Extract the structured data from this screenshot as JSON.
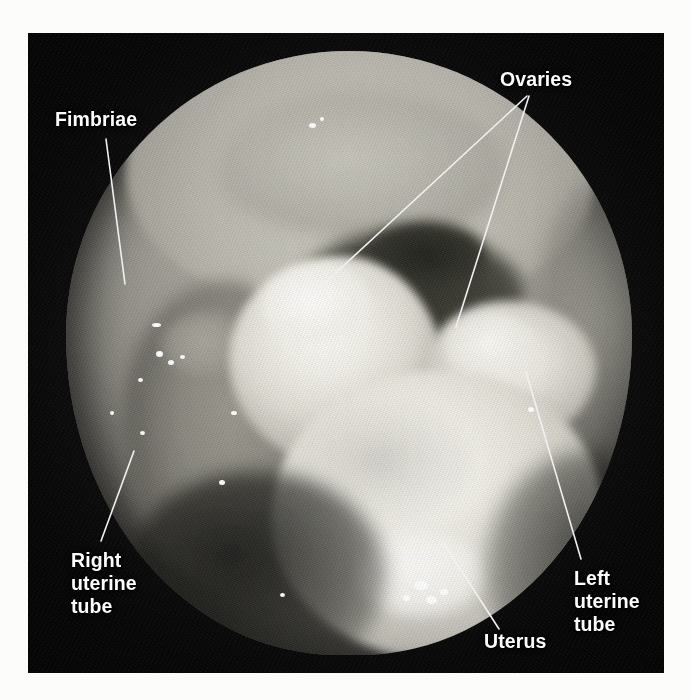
{
  "figure": {
    "type": "laparoscopic-photograph",
    "frame": {
      "left": 28,
      "top": 33,
      "width": 636,
      "height": 640,
      "background_color": "#090909"
    },
    "page_background_color": "#fdfdfb",
    "label_color": "#ffffff",
    "leader_line_color": "#f2f2f2"
  },
  "annotations": [
    {
      "id": "fimbriae",
      "label": "Fimbriae",
      "lines": [
        "Fimbriae"
      ],
      "label_x": 55,
      "label_y": 108,
      "leader": {
        "x1": 106,
        "y1": 139,
        "x2": 125,
        "y2": 284
      }
    },
    {
      "id": "ovaries",
      "label": "Ovaries",
      "lines": [
        "Ovaries"
      ],
      "label_x": 500,
      "label_y": 68,
      "leaders": [
        {
          "x1": 527,
          "y1": 96,
          "x2": 300,
          "y2": 306
        },
        {
          "x1": 529,
          "y1": 96,
          "x2": 456,
          "y2": 327
        }
      ]
    },
    {
      "id": "right-uterine-tube",
      "label": "Right uterine tube",
      "lines": [
        "Right",
        "uterine",
        "tube"
      ],
      "label_x": 71,
      "label_y": 549,
      "leader": {
        "x1": 134,
        "y1": 451,
        "x2": 101,
        "y2": 541
      }
    },
    {
      "id": "left-uterine-tube",
      "label": "Left uterine tube",
      "lines": [
        "Left",
        "uterine",
        "tube"
      ],
      "label_x": 574,
      "label_y": 567,
      "leader": {
        "x1": 526,
        "y1": 372,
        "x2": 581,
        "y2": 559
      }
    },
    {
      "id": "uterus",
      "label": "Uterus",
      "lines": [
        "Uterus"
      ],
      "label_x": 484,
      "label_y": 630,
      "leader": {
        "x1": 443,
        "y1": 542,
        "x2": 499,
        "y2": 629
      }
    }
  ],
  "labels": {
    "fimbriae": "Fimbriae",
    "ovaries": "Ovaries",
    "right_uterine_tube": "Right\nuterine\ntube",
    "left_uterine_tube": "Left\nuterine\ntube",
    "uterus": "Uterus"
  },
  "specular_highlights": [
    {
      "x": 281,
      "y": 90,
      "w": 7,
      "h": 5
    },
    {
      "x": 292,
      "y": 84,
      "w": 4,
      "h": 4
    },
    {
      "x": 124,
      "y": 290,
      "w": 9,
      "h": 4
    },
    {
      "x": 128,
      "y": 318,
      "w": 7,
      "h": 6
    },
    {
      "x": 140,
      "y": 327,
      "w": 6,
      "h": 5
    },
    {
      "x": 152,
      "y": 322,
      "w": 5,
      "h": 4
    },
    {
      "x": 110,
      "y": 345,
      "w": 5,
      "h": 4
    },
    {
      "x": 82,
      "y": 378,
      "w": 4,
      "h": 4
    },
    {
      "x": 112,
      "y": 398,
      "w": 5,
      "h": 4
    },
    {
      "x": 203,
      "y": 378,
      "w": 6,
      "h": 4
    },
    {
      "x": 191,
      "y": 447,
      "w": 6,
      "h": 5
    },
    {
      "x": 386,
      "y": 548,
      "w": 14,
      "h": 9
    },
    {
      "x": 398,
      "y": 563,
      "w": 11,
      "h": 8
    },
    {
      "x": 412,
      "y": 556,
      "w": 8,
      "h": 6
    },
    {
      "x": 375,
      "y": 562,
      "w": 7,
      "h": 6
    },
    {
      "x": 500,
      "y": 374,
      "w": 6,
      "h": 5
    },
    {
      "x": 252,
      "y": 560,
      "w": 5,
      "h": 4
    }
  ]
}
